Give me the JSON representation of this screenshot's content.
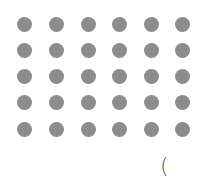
{
  "grid": {
    "columns": 6,
    "rows": 5,
    "col_centers": [
      24,
      56,
      88,
      119,
      151,
      182
    ],
    "row_centers": [
      24,
      50,
      76,
      102,
      129
    ],
    "dot_diameter": 15,
    "dot_color": "#8c8c8c"
  },
  "partial_text": "("
}
